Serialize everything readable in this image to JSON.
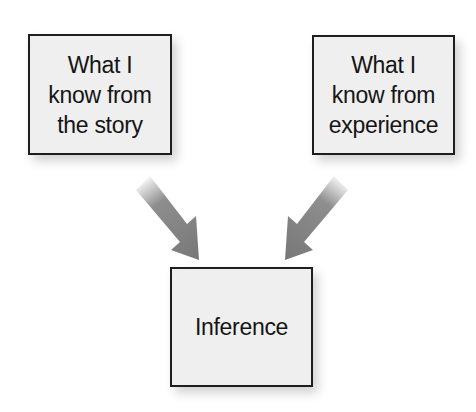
{
  "diagram": {
    "type": "flow",
    "nodes": [
      {
        "id": "story",
        "label": "What I know from the story",
        "lines": [
          "What I",
          "know from",
          "the story"
        ]
      },
      {
        "id": "experience",
        "label": "What I know from experience",
        "lines": [
          "What I",
          "know from",
          "experience"
        ]
      },
      {
        "id": "inference",
        "label": "Inference",
        "lines": [
          "Inference"
        ]
      }
    ],
    "edges": [
      {
        "from": "story",
        "to": "inference"
      },
      {
        "from": "experience",
        "to": "inference"
      }
    ],
    "colors": {
      "box_fill": "#efefef",
      "box_border": "#1e1e1e",
      "arrow": "#7a7a7a",
      "text": "#151515"
    }
  }
}
